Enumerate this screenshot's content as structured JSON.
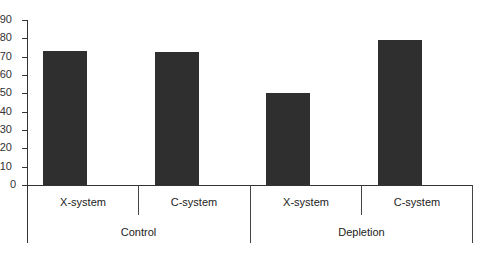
{
  "chart_data": {
    "type": "bar",
    "title": "",
    "xlabel": "",
    "ylabel": "",
    "ylim": [
      0,
      90
    ],
    "yticks": [
      0,
      10,
      20,
      30,
      40,
      50,
      60,
      70,
      80,
      90
    ],
    "grid": false,
    "legend": null,
    "groups": [
      "Control",
      "Depletion"
    ],
    "categories": [
      "X-system",
      "C-system",
      "X-system",
      "C-system"
    ],
    "bars": [
      {
        "group": "Control",
        "category": "X-system",
        "value": 73
      },
      {
        "group": "Control",
        "category": "C-system",
        "value": 72.5
      },
      {
        "group": "Depletion",
        "category": "X-system",
        "value": 50
      },
      {
        "group": "Depletion",
        "category": "C-system",
        "value": 79
      }
    ],
    "values": [
      73,
      72.5,
      50,
      79
    ],
    "bar_color": "#2f2f2f"
  },
  "labels": {
    "yticks": [
      "0",
      "10",
      "20",
      "30",
      "40",
      "50",
      "60",
      "70",
      "80",
      "90"
    ],
    "categories": [
      "X-system",
      "C-system",
      "X-system",
      "C-system"
    ],
    "groups": [
      "Control",
      "Depletion"
    ]
  }
}
